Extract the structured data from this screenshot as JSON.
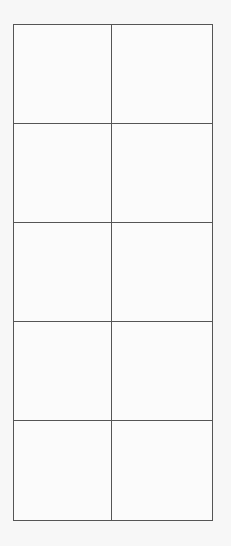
{
  "grid": {
    "columns": 2,
    "rows": 5,
    "line_color": "#555555",
    "background_color": "#f7f7f7",
    "cells": [
      [
        "",
        ""
      ],
      [
        "",
        ""
      ],
      [
        "",
        ""
      ],
      [
        "",
        ""
      ],
      [
        "",
        ""
      ]
    ]
  }
}
